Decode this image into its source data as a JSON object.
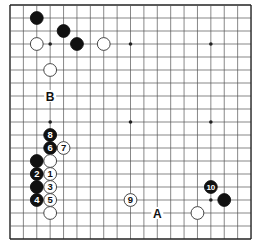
{
  "board": {
    "size": 19,
    "origin_x": 10,
    "origin_y": 5,
    "spacing_x": 13.39,
    "spacing_y": 13.0,
    "line_color": "#555555",
    "edge_color": "#222222",
    "star_points": [
      [
        3,
        3
      ],
      [
        9,
        3
      ],
      [
        15,
        3
      ],
      [
        3,
        9
      ],
      [
        9,
        9
      ],
      [
        15,
        9
      ],
      [
        3,
        15
      ],
      [
        9,
        15
      ],
      [
        15,
        15
      ]
    ]
  },
  "stones": [
    {
      "color": "black",
      "col": 2,
      "row": 1,
      "label": ""
    },
    {
      "color": "black",
      "col": 4,
      "row": 2,
      "label": ""
    },
    {
      "color": "black",
      "col": 5,
      "row": 3,
      "label": ""
    },
    {
      "color": "white",
      "col": 2,
      "row": 3,
      "label": ""
    },
    {
      "color": "white",
      "col": 7,
      "row": 3,
      "label": ""
    },
    {
      "color": "white",
      "col": 3,
      "row": 5,
      "label": ""
    },
    {
      "color": "black",
      "col": 3,
      "row": 10,
      "label": "8"
    },
    {
      "color": "black",
      "col": 3,
      "row": 11,
      "label": "6"
    },
    {
      "color": "white",
      "col": 4,
      "row": 11,
      "label": "7"
    },
    {
      "color": "black",
      "col": 2,
      "row": 12,
      "label": ""
    },
    {
      "color": "white",
      "col": 3,
      "row": 12,
      "label": ""
    },
    {
      "color": "black",
      "col": 2,
      "row": 13,
      "label": "2"
    },
    {
      "color": "white",
      "col": 3,
      "row": 13,
      "label": "1"
    },
    {
      "color": "black",
      "col": 2,
      "row": 14,
      "label": ""
    },
    {
      "color": "white",
      "col": 3,
      "row": 14,
      "label": "3"
    },
    {
      "color": "black",
      "col": 2,
      "row": 15,
      "label": "4"
    },
    {
      "color": "white",
      "col": 3,
      "row": 15,
      "label": "5"
    },
    {
      "color": "white",
      "col": 3,
      "row": 16,
      "label": ""
    },
    {
      "color": "white",
      "col": 9,
      "row": 15,
      "label": "9"
    },
    {
      "color": "black",
      "col": 15,
      "row": 14,
      "label": "10"
    },
    {
      "color": "black",
      "col": 16,
      "row": 15,
      "label": ""
    },
    {
      "color": "white",
      "col": 14,
      "row": 16,
      "label": ""
    }
  ],
  "markers": [
    {
      "text": "B",
      "col": 3,
      "row": 7
    },
    {
      "text": "A",
      "col": 11,
      "row": 16
    }
  ]
}
